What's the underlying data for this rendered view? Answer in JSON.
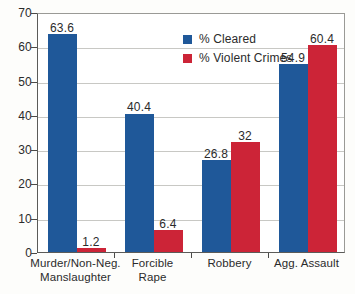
{
  "chart_data": {
    "type": "bar",
    "title": "",
    "subtitle": "",
    "xlabel": "",
    "ylabel": "",
    "ylim": [
      0,
      70
    ],
    "ytick_step": 10,
    "yticks": [
      "0",
      "10",
      "20",
      "30",
      "40",
      "50",
      "60",
      "70"
    ],
    "grid": true,
    "legend_position": "top-center",
    "categories": [
      "Murder/Non-Neg.\nManslaughter",
      "Forcible\nRape",
      "Robbery",
      "Agg. Assault"
    ],
    "series": [
      {
        "name": "% Cleared",
        "color": "#1F5899",
        "values": [
          63.6,
          40.4,
          26.8,
          54.9
        ],
        "labels": [
          "63.6",
          "40.4",
          "26.8",
          "54.9"
        ]
      },
      {
        "name": "% Violent Crimes",
        "color": "#CC2437",
        "values": [
          1.2,
          6.4,
          32,
          60.4
        ],
        "labels": [
          "1.2",
          "6.4",
          "32",
          "60.4"
        ]
      }
    ]
  },
  "legend": {
    "items": [
      {
        "label": "% Cleared",
        "swatch": "legend-swatch-cleared"
      },
      {
        "label": "% Violent Crimes",
        "swatch": "legend-swatch-violent"
      }
    ]
  },
  "colors": {
    "cleared": "#1F5899",
    "violent": "#CC2437",
    "axis": "#4A4A48",
    "grid": "#C8C8C4",
    "background": "#FDFDFB",
    "plot_background": "#FFFFFF",
    "text": "#2B2B2B"
  }
}
